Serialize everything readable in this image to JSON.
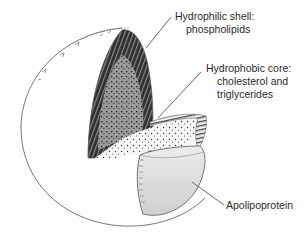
{
  "diagram": {
    "labels": {
      "shell": {
        "line1": "Hydrophilic shell:",
        "line2": "phospholipids"
      },
      "core": {
        "line1": "Hydrophobic core:",
        "line2": "cholesterol and",
        "line3": "triglycerides"
      },
      "protein": {
        "line1": "Apolipoprotein"
      }
    },
    "colors": {
      "outline": "#555555",
      "shell_dark": "#3a3a3a",
      "core_gray": "#9a9a9a",
      "core_light": "#f2f2f2",
      "apolipoprotein": "#d6d6d6",
      "text": "#2a2a2a"
    }
  }
}
